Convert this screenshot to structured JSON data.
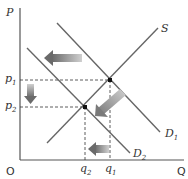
{
  "diagram": {
    "type": "supply-demand",
    "axes": {
      "y_label": "P",
      "x_label": "Q",
      "origin_label": "O"
    },
    "curves": {
      "supply": {
        "label": "S"
      },
      "demand_1": {
        "label": "D",
        "subscript": "1"
      },
      "demand_2": {
        "label": "D",
        "subscript": "2"
      }
    },
    "price_levels": [
      {
        "label": "p",
        "subscript": "1"
      },
      {
        "label": "p",
        "subscript": "2"
      }
    ],
    "quantity_levels": [
      {
        "label": "q",
        "subscript": "2"
      },
      {
        "label": "q",
        "subscript": "1"
      }
    ],
    "arrows": [
      {
        "meaning": "demand shifts left"
      },
      {
        "meaning": "price falls from p1 to p2"
      },
      {
        "meaning": "movement along supply curve to new equilibrium"
      },
      {
        "meaning": "quantity falls from q1 to q2"
      }
    ],
    "colors": {
      "line": "#555555",
      "arrow": "#888888",
      "dash": "#333333"
    }
  }
}
